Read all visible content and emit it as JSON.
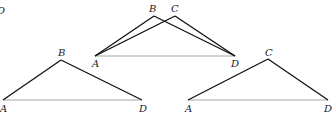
{
  "corner_fragment": "D",
  "colors": {
    "edge": "#111111",
    "base": "#a8a8a8"
  },
  "diagrams": [
    {
      "id": "overlay",
      "labels": {
        "A": "A",
        "B": "B",
        "C": "C",
        "D": "D"
      },
      "points": {
        "A": [
          95,
          56
        ],
        "B": [
          154,
          16
        ],
        "C": [
          175,
          16
        ],
        "D": [
          235,
          56
        ]
      }
    },
    {
      "id": "triangle-ABD",
      "labels": {
        "A": "A",
        "B": "B",
        "D": "D"
      },
      "points": {
        "A": [
          3,
          100
        ],
        "B": [
          61,
          60
        ],
        "D": [
          142,
          100
        ]
      }
    },
    {
      "id": "triangle-ACD",
      "labels": {
        "A": "A",
        "C": "C",
        "D": "D"
      },
      "points": {
        "A": [
          188,
          100
        ],
        "C": [
          268,
          59
        ],
        "D": [
          328,
          100
        ]
      }
    }
  ]
}
